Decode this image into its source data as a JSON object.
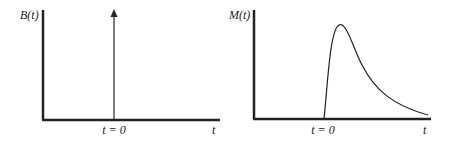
{
  "left_plot": {
    "y_label": "B(t)",
    "x_label": "t",
    "tick_label": "t = 0",
    "description": "impulse at t = 0"
  },
  "right_plot": {
    "y_label": "M(t)",
    "x_label": "t",
    "tick_label": "t = 0",
    "description": "response rising sharply at t = 0, peaking, then decaying"
  },
  "colors": {
    "line": "#222222",
    "background": "#ffffff"
  }
}
